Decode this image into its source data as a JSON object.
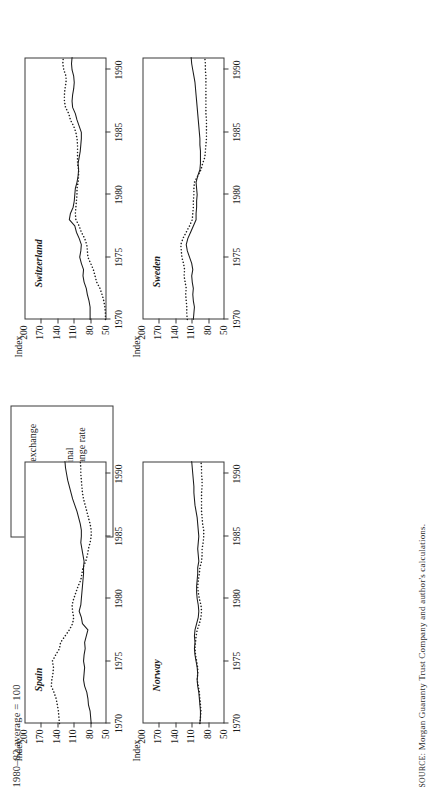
{
  "figure": {
    "caption": "1980–82 average = 100",
    "source_prefix": "SOURCE:",
    "source_text": "Morgan Guaranty Trust Company and author's calculations."
  },
  "legend": {
    "items": [
      {
        "key": "real",
        "label": "Real exchange rate",
        "style": "solid",
        "swatch": "solid-line-icon"
      },
      {
        "key": "nominal",
        "label": "Nominal exchange rate",
        "style": "dotted",
        "swatch": "dotted-line-icon"
      }
    ]
  },
  "axes": {
    "y_name": "Index",
    "y_ticks": [
      "200",
      "170",
      "140",
      "110",
      "80",
      "50"
    ],
    "x_ticks": [
      "1970",
      "1975",
      "1980",
      "1985",
      "1990"
    ],
    "ylim": [
      50,
      200
    ],
    "xlim": [
      1970,
      1991
    ]
  },
  "chart_data": [
    {
      "type": "line",
      "title": "Norway",
      "xlabel": "",
      "ylabel": "Index",
      "ylim": [
        50,
        200
      ],
      "xlim": [
        1970,
        1991
      ],
      "grid": false,
      "legend_position": "external-top-right",
      "x": [
        1970,
        1970.5,
        1971,
        1971.5,
        1972,
        1972.5,
        1973,
        1973.5,
        1974,
        1974.5,
        1975,
        1975.5,
        1976,
        1976.5,
        1977,
        1977.5,
        1978,
        1978.5,
        1979,
        1979.5,
        1980,
        1980.5,
        1981,
        1981.5,
        1982,
        1982.5,
        1983,
        1983.5,
        1984,
        1984.5,
        1985,
        1985.5,
        1986,
        1986.5,
        1987,
        1987.5,
        1988,
        1988.5,
        1989,
        1989.5,
        1990,
        1990.5,
        1991
      ],
      "series": [
        {
          "name": "Real exchange rate",
          "style": "solid",
          "values": [
            95,
            94,
            94,
            95,
            96,
            97,
            99,
            100,
            99,
            100,
            102,
            104,
            105,
            104,
            105,
            104,
            101,
            98,
            97,
            98,
            100,
            101,
            101,
            100,
            99,
            99,
            97,
            98,
            99,
            98,
            97,
            98,
            99,
            100,
            102,
            104,
            105,
            106,
            106,
            107,
            108,
            109,
            110
          ]
        },
        {
          "name": "Nominal exchange rate",
          "style": "dotted",
          "values": [
            95,
            94,
            93,
            94,
            95,
            96,
            98,
            100,
            99,
            99,
            101,
            103,
            104,
            103,
            102,
            100,
            96,
            93,
            92,
            93,
            96,
            98,
            99,
            98,
            96,
            95,
            92,
            91,
            91,
            89,
            88,
            88,
            90,
            91,
            92,
            92,
            92,
            92,
            91,
            91,
            92,
            92,
            93
          ]
        }
      ]
    },
    {
      "type": "line",
      "title": "Spain",
      "xlabel": "",
      "ylabel": "Index",
      "ylim": [
        50,
        200
      ],
      "xlim": [
        1970,
        1991
      ],
      "grid": false,
      "legend_position": "external-top-right",
      "x": [
        1970,
        1970.5,
        1971,
        1971.5,
        1972,
        1972.5,
        1973,
        1973.5,
        1974,
        1974.5,
        1975,
        1975.5,
        1976,
        1976.5,
        1977,
        1977.5,
        1978,
        1978.5,
        1979,
        1979.5,
        1980,
        1980.5,
        1981,
        1981.5,
        1982,
        1982.5,
        1983,
        1983.5,
        1984,
        1984.5,
        1985,
        1985.5,
        1986,
        1986.5,
        1987,
        1987.5,
        1988,
        1988.5,
        1989,
        1989.5,
        1990,
        1990.5,
        1991
      ],
      "series": [
        {
          "name": "Real exchange rate",
          "style": "solid",
          "values": [
            78,
            79,
            80,
            83,
            84,
            86,
            90,
            92,
            91,
            90,
            92,
            91,
            89,
            90,
            87,
            84,
            94,
            96,
            100,
            97,
            96,
            95,
            94,
            93,
            92,
            92,
            91,
            93,
            95,
            97,
            96,
            96,
            98,
            101,
            104,
            108,
            112,
            115,
            118,
            121,
            123,
            125,
            126
          ]
        },
        {
          "name": "Nominal exchange rate",
          "style": "dotted",
          "values": [
            136,
            137,
            138,
            140,
            142,
            146,
            151,
            150,
            148,
            147,
            149,
            143,
            136,
            134,
            126,
            118,
            112,
            110,
            112,
            113,
            110,
            106,
            102,
            97,
            95,
            93,
            88,
            85,
            83,
            80,
            78,
            78,
            80,
            83,
            86,
            89,
            92,
            94,
            95,
            96,
            97,
            97,
            98
          ]
        }
      ]
    },
    {
      "type": "line",
      "title": "Sweden",
      "xlabel": "",
      "ylabel": "Index",
      "ylim": [
        50,
        200
      ],
      "xlim": [
        1970,
        1991
      ],
      "grid": false,
      "legend_position": "external-top-right",
      "x": [
        1970,
        1970.5,
        1971,
        1971.5,
        1972,
        1972.5,
        1973,
        1973.5,
        1974,
        1974.5,
        1975,
        1975.5,
        1976,
        1976.5,
        1977,
        1977.5,
        1978,
        1978.5,
        1979,
        1979.5,
        1980,
        1980.5,
        1981,
        1981.5,
        1982,
        1982.5,
        1983,
        1983.5,
        1984,
        1984.5,
        1985,
        1985.5,
        1986,
        1986.5,
        1987,
        1987.5,
        1988,
        1988.5,
        1989,
        1989.5,
        1990,
        1990.5,
        1991
      ],
      "series": [
        {
          "name": "Real exchange rate",
          "style": "solid",
          "values": [
            107,
            106,
            105,
            107,
            108,
            107,
            109,
            110,
            108,
            110,
            114,
            118,
            120,
            117,
            112,
            107,
            102,
            102,
            101,
            101,
            100,
            101,
            102,
            99,
            95,
            94,
            94,
            94,
            95,
            95,
            96,
            97,
            98,
            99,
            100,
            101,
            102,
            103,
            104,
            106,
            108,
            110,
            111
          ]
        },
        {
          "name": "Nominal exchange rate",
          "style": "dotted",
          "values": [
            118,
            119,
            119,
            120,
            121,
            120,
            122,
            124,
            123,
            125,
            128,
            129,
            130,
            126,
            120,
            114,
            109,
            108,
            107,
            107,
            106,
            106,
            105,
            99,
            93,
            90,
            86,
            85,
            84,
            83,
            83,
            83,
            83,
            84,
            84,
            84,
            84,
            84,
            84,
            84,
            85,
            85,
            86
          ]
        }
      ]
    },
    {
      "type": "line",
      "title": "Switzerland",
      "xlabel": "",
      "ylabel": "Index",
      "ylim": [
        50,
        200
      ],
      "xlim": [
        1970,
        1991
      ],
      "grid": false,
      "legend_position": "external-top-right",
      "x": [
        1970,
        1970.5,
        1971,
        1971.5,
        1972,
        1972.5,
        1973,
        1973.5,
        1974,
        1974.5,
        1975,
        1975.5,
        1976,
        1976.5,
        1977,
        1977.5,
        1978,
        1978.5,
        1979,
        1979.5,
        1980,
        1980.5,
        1981,
        1981.5,
        1982,
        1982.5,
        1983,
        1983.5,
        1984,
        1984.5,
        1985,
        1985.5,
        1986,
        1986.5,
        1987,
        1987.5,
        1988,
        1988.5,
        1989,
        1989.5,
        1990,
        1990.5,
        1991
      ],
      "series": [
        {
          "name": "Real exchange rate",
          "style": "solid",
          "values": [
            80,
            80,
            80,
            82,
            85,
            87,
            91,
            93,
            92,
            96,
            99,
            97,
            96,
            100,
            105,
            108,
            118,
            116,
            111,
            109,
            108,
            107,
            104,
            102,
            101,
            102,
            100,
            98,
            97,
            96,
            96,
            100,
            104,
            107,
            112,
            113,
            112,
            110,
            109,
            110,
            113,
            114,
            113
          ]
        },
        {
          "name": "Nominal exchange rate",
          "style": "dotted",
          "values": [
            52,
            52,
            53,
            55,
            58,
            62,
            68,
            71,
            74,
            79,
            84,
            85,
            86,
            90,
            96,
            100,
            106,
            107,
            106,
            105,
            104,
            104,
            102,
            101,
            101,
            103,
            103,
            103,
            103,
            104,
            106,
            110,
            116,
            119,
            125,
            127,
            127,
            126,
            124,
            124,
            128,
            130,
            129
          ]
        }
      ]
    }
  ]
}
